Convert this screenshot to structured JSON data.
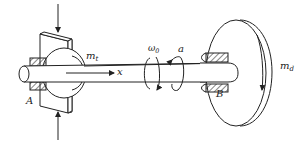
{
  "diagram": {
    "colors": {
      "line": "#222222",
      "hatch": "#333333",
      "background": "#ffffff"
    },
    "labels": {
      "mt_base": "m",
      "mt_sub": "t",
      "x_axis": "x",
      "omega_base": "ω",
      "omega_sub": "0",
      "alpha": "a",
      "point_a": "A",
      "point_b": "B",
      "md_base": "m",
      "md_sub": "d"
    },
    "elements": [
      "top-force-arrow",
      "bottom-force-arrow",
      "bearing-bracket-plate",
      "bearing-a",
      "shaft",
      "x-axis-arrow",
      "omega-rotation-arrow",
      "alpha-rotation-arrow",
      "disk",
      "hub-b",
      "disk-rotation-arrow"
    ]
  }
}
